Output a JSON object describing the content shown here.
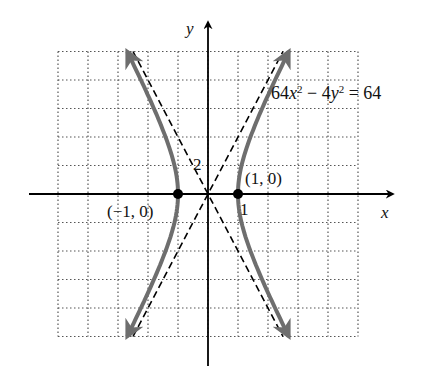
{
  "chart_data": {
    "type": "line",
    "title": "",
    "equation": "64x² − 4y² = 64",
    "xlabel": "x",
    "ylabel": "y",
    "xlim": [
      -5,
      5
    ],
    "ylim": [
      -10,
      10
    ],
    "grid": true,
    "grid_style": "dotted",
    "x_grid_step": 1,
    "y_grid_step": 2,
    "tick_labels": {
      "x": [
        "1"
      ],
      "y": [
        "2"
      ]
    },
    "series": [
      {
        "name": "hyperbola right branch",
        "style": "solid gray, arrows both ends",
        "function": "x = sqrt(1 + y^2/16)",
        "y_range": [
          -10,
          10
        ]
      },
      {
        "name": "hyperbola left branch",
        "style": "solid gray, arrows both ends",
        "function": "x = -sqrt(1 + y^2/16)",
        "y_range": [
          -10,
          10
        ]
      },
      {
        "name": "asymptote y = 4x",
        "style": "dashed black"
      },
      {
        "name": "asymptote y = -4x",
        "style": "dashed black"
      }
    ],
    "points": [
      {
        "label": "(1, 0)",
        "x": 1,
        "y": 0
      },
      {
        "label": "(−1, 0)",
        "x": -1,
        "y": 0
      }
    ],
    "annotations": [
      "64x² − 4y² = 64",
      "(1, 0)",
      "(−1, 0)",
      "1",
      "2"
    ]
  },
  "labels": {
    "eq_a": "64",
    "eq_x": "x",
    "eq_exp1": "2",
    "eq_mid": " − 4",
    "eq_y": "y",
    "eq_exp2": "2",
    "eq_end": " = 64",
    "x_axis": "x",
    "y_axis": "y",
    "pt_right": "(1, 0)",
    "pt_left": "(−1, 0)",
    "tick_x": "1",
    "tick_y": "2"
  },
  "colors": {
    "curve": "#6e6e6e",
    "axis": "#000000",
    "grid": "#555555"
  }
}
